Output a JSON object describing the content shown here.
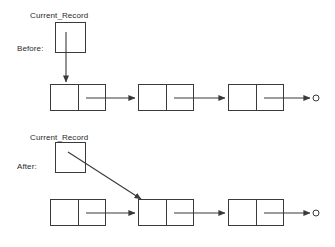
{
  "figure": {
    "type": "linked-list-diagram",
    "line_color": "#3a3a3a",
    "background_color": "#ffffff",
    "text_color": "#1a1a1a"
  },
  "sections": [
    {
      "id": "before",
      "stage_label": "Before:",
      "pointer_label": "Current_Record",
      "pointer_target": "73",
      "pointer_arrow": "vertical-down",
      "nodes": [
        {
          "value": "73",
          "next": "34"
        },
        {
          "value": "34",
          "next": "14"
        },
        {
          "value": "14",
          "next": "null"
        }
      ],
      "terminator": "null-circle"
    },
    {
      "id": "after",
      "stage_label": "After:",
      "pointer_label": "Current_Record",
      "pointer_target": "34",
      "pointer_arrow": "diagonal-down-right",
      "nodes": [
        {
          "value": "73",
          "next": "34"
        },
        {
          "value": "34",
          "next": "14"
        },
        {
          "value": "14",
          "next": "null"
        }
      ],
      "terminator": "null-circle"
    }
  ]
}
